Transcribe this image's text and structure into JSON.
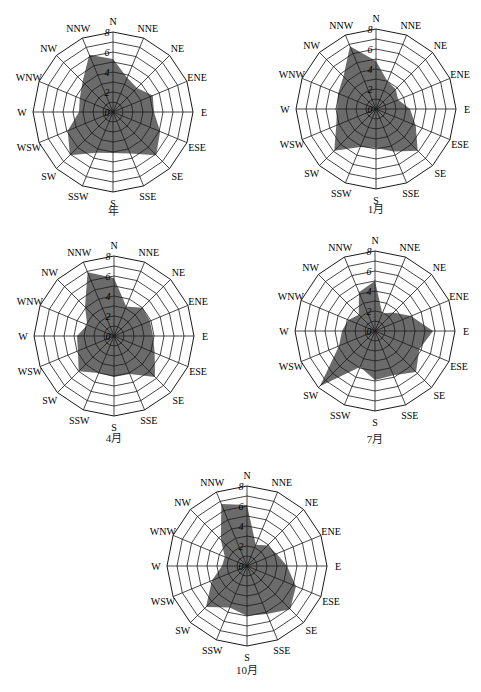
{
  "chart_data": [
    {
      "type": "radar",
      "title": "年",
      "directions": [
        "N",
        "NNE",
        "NE",
        "ENE",
        "E",
        "ESE",
        "SE",
        "SSE",
        "S",
        "SSW",
        "SW",
        "WSW",
        "W",
        "WNW",
        "NW",
        "NNW"
      ],
      "values": [
        5.3,
        3.7,
        3.4,
        4.3,
        4.1,
        5.1,
        6.1,
        4.5,
        4.1,
        4.4,
        6.1,
        4.9,
        3.4,
        3.6,
        4.3,
        6.2
      ],
      "ticks": [
        "0",
        "2",
        "4",
        "6",
        "8"
      ],
      "rlim": [
        0,
        8
      ]
    },
    {
      "type": "radar",
      "title": "1月",
      "directions": [
        "N",
        "NNE",
        "NE",
        "ENE",
        "E",
        "ESE",
        "SE",
        "SSE",
        "S",
        "SSW",
        "SW",
        "WSW",
        "W",
        "WNW",
        "NW",
        "NNW"
      ],
      "values": [
        4.8,
        3.0,
        2.8,
        2.4,
        3.4,
        4.3,
        5.9,
        4.6,
        3.9,
        4.1,
        5.9,
        4.3,
        3.9,
        4.1,
        4.6,
        6.8
      ],
      "ticks": [
        "0",
        "2",
        "4",
        "6",
        "8"
      ],
      "rlim": [
        0,
        8
      ]
    },
    {
      "type": "radar",
      "title": "4月",
      "directions": [
        "N",
        "NNE",
        "NE",
        "ENE",
        "E",
        "ESE",
        "SE",
        "SSE",
        "S",
        "SSW",
        "SW",
        "WSW",
        "W",
        "WNW",
        "NW",
        "NNW"
      ],
      "values": [
        5.8,
        3.2,
        4.0,
        3.9,
        3.9,
        4.4,
        5.8,
        4.1,
        4.1,
        4.0,
        5.0,
        3.9,
        3.7,
        2.9,
        4.1,
        6.9
      ],
      "ticks": [
        "0",
        "2",
        "4",
        "6",
        "8"
      ],
      "rlim": [
        0,
        8
      ]
    },
    {
      "type": "radar",
      "title": "7月",
      "directions": [
        "N",
        "NNE",
        "NE",
        "ENE",
        "E",
        "ESE",
        "SE",
        "SSE",
        "S",
        "SSW",
        "SW",
        "WSW",
        "W",
        "WNW",
        "NW",
        "NNW"
      ],
      "values": [
        5.0,
        1.9,
        2.6,
        3.9,
        5.8,
        4.8,
        5.8,
        4.8,
        4.9,
        3.9,
        7.8,
        3.9,
        3.3,
        2.9,
        2.3,
        4.2
      ],
      "ticks": [
        "0",
        "2",
        "4",
        "6",
        "8"
      ],
      "rlim": [
        0,
        8
      ]
    },
    {
      "type": "radar",
      "title": "10月",
      "directions": [
        "N",
        "NNE",
        "NE",
        "ENE",
        "E",
        "ESE",
        "SE",
        "SSE",
        "S",
        "SSW",
        "SW",
        "WSW",
        "W",
        "WNW",
        "NW",
        "NNW"
      ],
      "values": [
        6.1,
        2.3,
        2.9,
        3.2,
        4.0,
        5.3,
        6.1,
        5.2,
        5.0,
        4.5,
        5.8,
        3.8,
        2.5,
        2.4,
        3.7,
        6.7
      ],
      "ticks": [
        "0",
        "2",
        "4",
        "6",
        "8"
      ],
      "rlim": [
        0,
        8
      ]
    }
  ],
  "layout": [
    {
      "cx": 113,
      "cy": 112,
      "r": 80,
      "captionY": 210
    },
    {
      "cx": 376,
      "cy": 109,
      "r": 80,
      "captionY": 208
    },
    {
      "cx": 114,
      "cy": 336,
      "r": 80,
      "captionY": 437
    },
    {
      "cx": 375,
      "cy": 331,
      "r": 80,
      "captionY": 438
    },
    {
      "cx": 247,
      "cy": 566,
      "r": 80,
      "captionY": 669
    }
  ],
  "style": {
    "fill": "#6b6b6b",
    "grid": "#1a1a1a"
  }
}
